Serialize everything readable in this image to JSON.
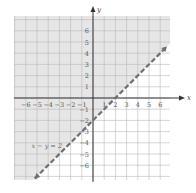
{
  "chart_data": {
    "type": "line",
    "title": "",
    "xlabel": "x",
    "ylabel": "y",
    "xlim": [
      -7,
      7
    ],
    "ylim": [
      -7,
      7
    ],
    "grid": true,
    "x_ticks": [
      "-6",
      "-5",
      "-4",
      "-3",
      "-2",
      "-1",
      "1",
      "2",
      "3",
      "4",
      "5",
      "6"
    ],
    "y_ticks": [
      "6",
      "5",
      "4",
      "3",
      "2",
      "1",
      "-1",
      "-2",
      "-3",
      "-4",
      "-5",
      "-6"
    ],
    "series": [
      {
        "name": "x − y = 2",
        "style": "dashed",
        "points": [
          [
            -5.2,
            -7.2
          ],
          [
            6.6,
            4.6
          ]
        ],
        "equation": "y = x - 2"
      }
    ],
    "shaded_region": "x - y < 2 (above/left of line)",
    "annotations": [
      {
        "text": "x − y = 2",
        "x": -5.5,
        "y": -4.5
      }
    ],
    "colors": {
      "shade": "#e6e6e6",
      "grid": "#b9b9b9",
      "line": "#6e6e6e",
      "axis": "#333333"
    }
  }
}
